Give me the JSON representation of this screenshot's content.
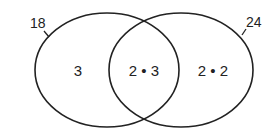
{
  "diagram": {
    "type": "venn",
    "sets": [
      {
        "label": "18",
        "region_label": "3"
      },
      {
        "label": "24",
        "region_label": "2 • 2"
      }
    ],
    "intersection_label": "2 • 3",
    "stroke_color": "#222222"
  }
}
